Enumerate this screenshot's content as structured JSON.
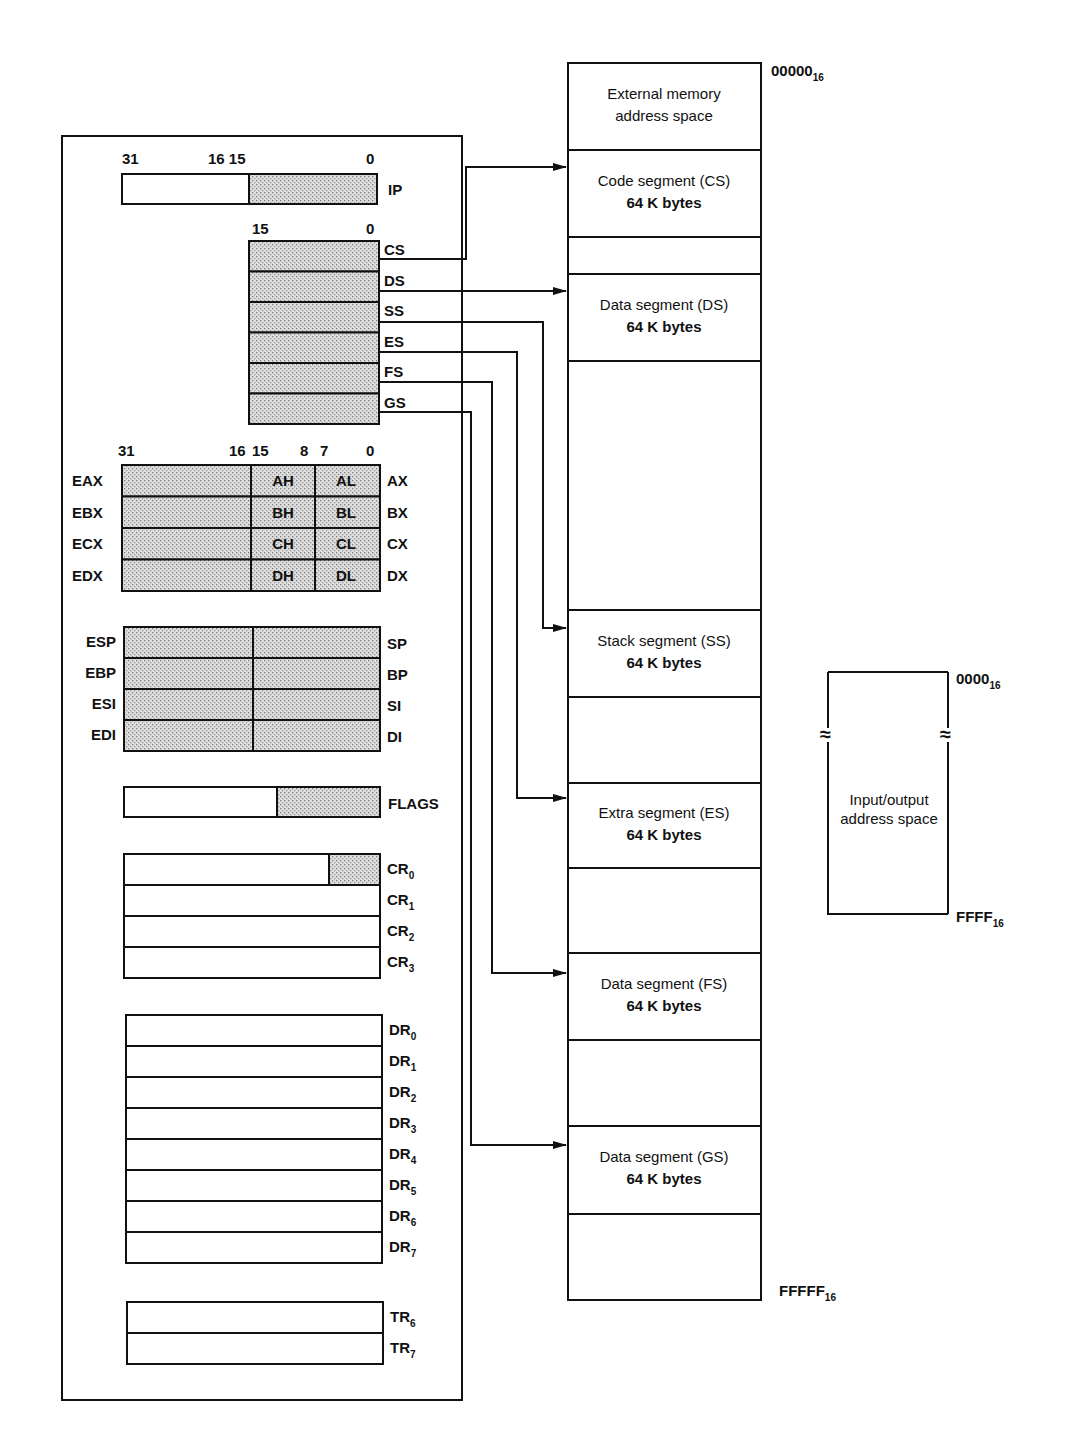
{
  "register_file": {
    "ip": {
      "bit_labels": [
        "31",
        "16 15",
        "0"
      ],
      "name": "IP"
    },
    "segment_registers": {
      "bit_labels": [
        "15",
        "0"
      ],
      "names": [
        "CS",
        "DS",
        "SS",
        "ES",
        "FS",
        "GS"
      ]
    },
    "general_registers": {
      "bit_labels": [
        "31",
        "16",
        "15",
        "8",
        "7",
        "0"
      ],
      "rows": [
        {
          "ext": "EAX",
          "high": "AH",
          "low": "AL",
          "word": "AX"
        },
        {
          "ext": "EBX",
          "high": "BH",
          "low": "BL",
          "word": "BX"
        },
        {
          "ext": "ECX",
          "high": "CH",
          "low": "CL",
          "word": "CX"
        },
        {
          "ext": "EDX",
          "high": "DH",
          "low": "DL",
          "word": "DX"
        }
      ]
    },
    "pointer_index_registers": [
      {
        "ext": "ESP",
        "word": "SP"
      },
      {
        "ext": "EBP",
        "word": "BP"
      },
      {
        "ext": "ESI",
        "word": "SI"
      },
      {
        "ext": "EDI",
        "word": "DI"
      }
    ],
    "flags": {
      "name": "FLAGS"
    },
    "control_registers": [
      {
        "base": "CR",
        "sub": "0"
      },
      {
        "base": "CR",
        "sub": "1"
      },
      {
        "base": "CR",
        "sub": "2"
      },
      {
        "base": "CR",
        "sub": "3"
      }
    ],
    "debug_registers": [
      {
        "base": "DR",
        "sub": "0"
      },
      {
        "base": "DR",
        "sub": "1"
      },
      {
        "base": "DR",
        "sub": "2"
      },
      {
        "base": "DR",
        "sub": "3"
      },
      {
        "base": "DR",
        "sub": "4"
      },
      {
        "base": "DR",
        "sub": "5"
      },
      {
        "base": "DR",
        "sub": "6"
      },
      {
        "base": "DR",
        "sub": "7"
      }
    ],
    "test_registers": [
      {
        "base": "TR",
        "sub": "6"
      },
      {
        "base": "TR",
        "sub": "7"
      }
    ]
  },
  "memory": {
    "start_address": {
      "base": "00000",
      "sub": "16"
    },
    "end_address": {
      "base": "FFFFF",
      "sub": "16"
    },
    "blocks": [
      {
        "id": "external",
        "line1": "External memory",
        "line2": "address space",
        "top": 63,
        "bottom": 150
      },
      {
        "id": "cs",
        "line1": "Code segment (CS)",
        "line2": "64 K bytes",
        "top": 150,
        "bottom": 237,
        "pointer": "CS"
      },
      {
        "id": "gap1",
        "line1": "",
        "line2": "",
        "top": 237,
        "bottom": 274
      },
      {
        "id": "ds",
        "line1": "Data segment (DS)",
        "line2": "64 K bytes",
        "top": 274,
        "bottom": 361,
        "pointer": "DS"
      },
      {
        "id": "gap2",
        "line1": "",
        "line2": "",
        "top": 361,
        "bottom": 610
      },
      {
        "id": "ss",
        "line1": "Stack segment (SS)",
        "line2": "64 K bytes",
        "top": 610,
        "bottom": 697,
        "pointer": "SS"
      },
      {
        "id": "gap3",
        "line1": "",
        "line2": "",
        "top": 697,
        "bottom": 783
      },
      {
        "id": "es",
        "line1": "Extra segment (ES)",
        "line2": "64 K bytes",
        "top": 783,
        "bottom": 868,
        "pointer": "ES"
      },
      {
        "id": "gap4",
        "line1": "",
        "line2": "",
        "top": 868,
        "bottom": 953
      },
      {
        "id": "fs",
        "line1": "Data segment (FS)",
        "line2": "64 K bytes",
        "top": 953,
        "bottom": 1040,
        "pointer": "FS"
      },
      {
        "id": "gap5",
        "line1": "",
        "line2": "",
        "top": 1040,
        "bottom": 1126
      },
      {
        "id": "gs",
        "line1": "Data segment (GS)",
        "line2": "64 K bytes",
        "top": 1126,
        "bottom": 1214,
        "pointer": "GS"
      },
      {
        "id": "gap6",
        "line1": "",
        "line2": "",
        "top": 1214,
        "bottom": 1300
      }
    ]
  },
  "io_space": {
    "line1": "Input/output",
    "line2": "address space",
    "start_address": {
      "base": "0000",
      "sub": "16"
    },
    "end_address": {
      "base": "FFFF",
      "sub": "16"
    },
    "break_symbol": "≈"
  },
  "colors": {
    "line": "#111111",
    "shade": "#d4d4d4",
    "shade_dot": "#8a8a8a",
    "background": "#ffffff"
  }
}
